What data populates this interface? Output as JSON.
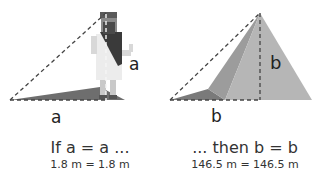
{
  "left_panel": {
    "side_label": "a",
    "base_label": "a",
    "caption": "If a = a ...",
    "measure": "1.8 m = 1.8 m"
  },
  "right_panel": {
    "side_label": "b",
    "base_label": "b",
    "caption": "... then b = b",
    "measure": "146.5 m = 146.5 m"
  },
  "colors": {
    "shadow": "#6e6e6e",
    "pyramid_light": "#b4b4b4",
    "pyramid_mid": "#9a9a9a",
    "robe_dark": "#3a3a3a",
    "tunic": "#e8e8e8",
    "dashes": "#444444"
  }
}
